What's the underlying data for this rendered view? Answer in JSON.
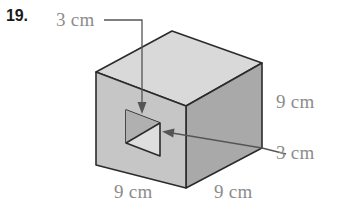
{
  "figure": {
    "problem_number": "19.",
    "shape": "cube-with-square-hole",
    "labels": {
      "hole_top": "3 cm",
      "height_right": "9 cm",
      "hole_right": "3 cm",
      "width_bottom_left": "9 cm",
      "depth_bottom_right": "9 cm"
    },
    "colors": {
      "top_face": "#d9d9d9",
      "front_face": "#c6c6c6",
      "right_face": "#a9a9a9",
      "hole_interior": "#b0b0b0",
      "hole_interior_light": "#dedede",
      "outline": "#2b2b2b",
      "label_text": "#8c8c8c",
      "number_text": "#1a1a1a",
      "background": "#ffffff"
    },
    "dimensions": {
      "cube_edge_cm": 9,
      "hole_edge_cm": 3,
      "units": "cm"
    }
  }
}
